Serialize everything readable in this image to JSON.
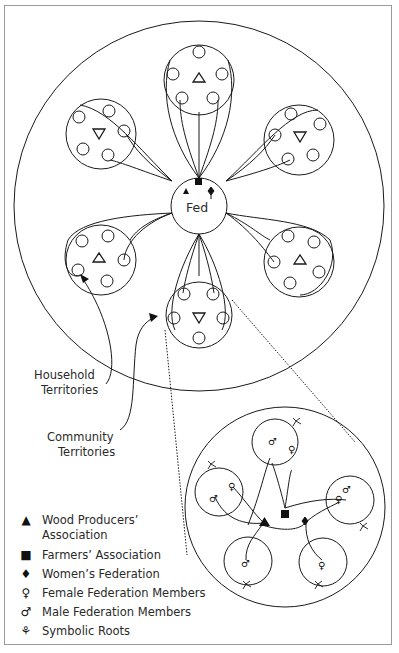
{
  "diagram": {
    "center_label": "Fed",
    "labels": {
      "household": [
        "Household",
        "Territories"
      ],
      "community": [
        "Community",
        "Territories"
      ]
    },
    "legend": [
      {
        "icon": "triangle-icon",
        "glyph": "▲",
        "label": "Wood Producers’",
        "label2": "Association"
      },
      {
        "icon": "square-icon",
        "glyph": "■",
        "label": "Farmers’ Association"
      },
      {
        "icon": "diamond-icon",
        "glyph": "♦",
        "label": "Women’s Federation"
      },
      {
        "icon": "female-icon",
        "glyph": "♀",
        "label": "Female Federation Members"
      },
      {
        "icon": "male-icon",
        "glyph": "♂",
        "label": "Male Federation Members"
      },
      {
        "icon": "roots-icon",
        "glyph": "⚘",
        "label": "Symbolic Roots"
      }
    ],
    "colors": {
      "line": "#1a1a1a",
      "frame": "#9a9a9a",
      "text": "#2a2a2a"
    }
  }
}
